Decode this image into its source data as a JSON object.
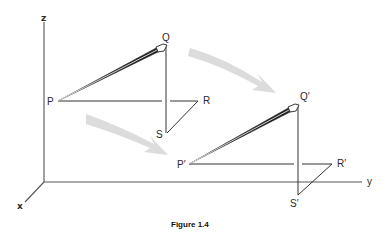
{
  "figure": {
    "caption": "Figure 1.4",
    "axes": {
      "x": "x",
      "y": "y",
      "z": "z"
    },
    "original_triangle": {
      "P": "P",
      "Q": "Q",
      "R": "R",
      "S": "S"
    },
    "translated_triangle": {
      "P": "P′",
      "Q": "Q′",
      "R": "R′",
      "S": "S′"
    },
    "colors": {
      "line": "#333333",
      "axis": "#555555",
      "arrow": "#d9d9d9"
    }
  }
}
